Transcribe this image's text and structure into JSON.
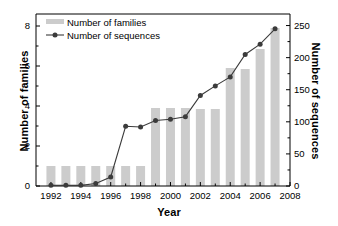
{
  "chart_data": {
    "type": "bar",
    "title": "",
    "xlabel": "Year",
    "ylabel": "Number of families",
    "ylabel_right": "Number of sequences",
    "categories": [
      1992,
      1993,
      1994,
      1995,
      1996,
      1997,
      1998,
      1999,
      2000,
      2001,
      2002,
      2003,
      2004,
      2005,
      2006,
      2007
    ],
    "xlim": [
      1991,
      2008
    ],
    "ylim": [
      0,
      8.6
    ],
    "ylim_right": [
      0,
      268
    ],
    "grid": false,
    "legend_position": "top-left",
    "series": [
      {
        "name": "Number of families",
        "type": "bar",
        "axis": "left",
        "color": "#cccccc",
        "values": [
          1,
          1,
          1,
          1,
          1,
          1,
          1,
          3.9,
          3.9,
          3.9,
          3.85,
          3.85,
          5.9,
          5.85,
          6.85,
          7.9
        ]
      },
      {
        "name": "Number of sequences",
        "type": "line",
        "axis": "right",
        "color": "#3b3b3b",
        "values": [
          1,
          1,
          1,
          4,
          14,
          93,
          92,
          102,
          104,
          108,
          141,
          156,
          170,
          205,
          221,
          245
        ]
      }
    ],
    "yticks_left": [
      0,
      2,
      4,
      6,
      8
    ],
    "yticks_right": [
      0,
      50,
      100,
      150,
      200,
      250
    ],
    "xticks": [
      1992,
      1994,
      1996,
      1998,
      2000,
      2002,
      2004,
      2006,
      2008
    ],
    "xticks_minor": [
      1993,
      1995,
      1997,
      1999,
      2001,
      2003,
      2005,
      2007
    ]
  },
  "legend": {
    "items": [
      {
        "label": "Number of families"
      },
      {
        "label": "Number of sequences"
      }
    ]
  },
  "axes": {
    "x_title": "Year",
    "y_title_left": "Number of families",
    "y_title_right": "Number of sequences",
    "y_ticks_left": [
      "0",
      "2",
      "4",
      "6",
      "8"
    ],
    "y_ticks_right": [
      "0",
      "50",
      "100",
      "150",
      "200",
      "250"
    ],
    "x_ticks": [
      "1992",
      "1994",
      "1996",
      "1998",
      "2000",
      "2002",
      "2004",
      "2006",
      "2008"
    ]
  },
  "colors": {
    "bar": "#cccccc",
    "line": "#3b3b3b",
    "axis": "#000000",
    "background": "#ffffff"
  }
}
